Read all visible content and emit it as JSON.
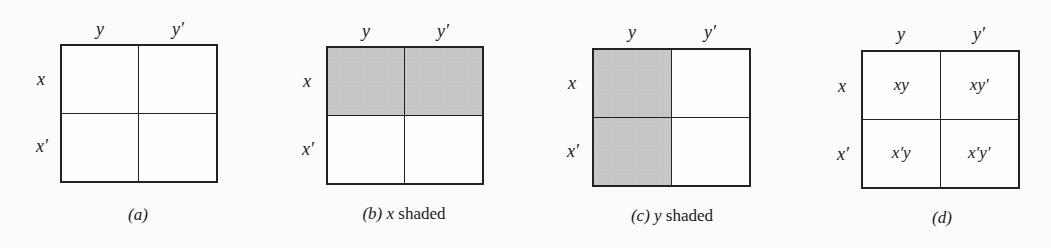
{
  "figure": {
    "column_labels": [
      "y",
      "y′"
    ],
    "row_labels": [
      "x",
      "x′"
    ],
    "shade_color": "#c5c5c5",
    "line_color": "#222222",
    "panels": [
      {
        "id": "a",
        "caption_letter": "(a)",
        "caption_var": "",
        "caption_text": "",
        "shaded_cells": [],
        "cell_labels": [
          "",
          "",
          "",
          ""
        ]
      },
      {
        "id": "b",
        "caption_letter": "(b)",
        "caption_var": " x",
        "caption_text": " shaded",
        "shaded_cells": [
          "xy",
          "xy′"
        ],
        "cell_labels": [
          "",
          "",
          "",
          ""
        ]
      },
      {
        "id": "c",
        "caption_letter": "(c)",
        "caption_var": " y",
        "caption_text": " shaded",
        "shaded_cells": [
          "xy",
          "x′y"
        ],
        "cell_labels": [
          "",
          "",
          "",
          ""
        ]
      },
      {
        "id": "d",
        "caption_letter": "(d)",
        "caption_var": "",
        "caption_text": "",
        "shaded_cells": [],
        "cell_labels": [
          "xy",
          "xy′",
          "x′y",
          "x′y′"
        ]
      }
    ]
  }
}
